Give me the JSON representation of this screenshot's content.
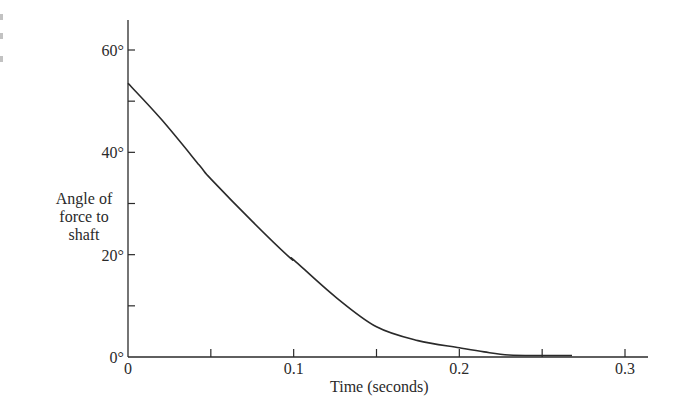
{
  "chart_data": {
    "type": "line",
    "title": "",
    "xlabel": "Time (seconds)",
    "ylabel": "Angle of force to shaft",
    "ylabel_lines": [
      "Angle of",
      "force to",
      "shaft"
    ],
    "xlim": [
      0,
      0.3
    ],
    "ylim": [
      0,
      60
    ],
    "x_ticks": [
      0,
      0.05,
      0.1,
      0.15,
      0.2,
      0.25,
      0.3
    ],
    "x_tick_labels": [
      "0",
      "",
      "0.1",
      "",
      "0.2",
      "",
      "0.3"
    ],
    "y_ticks": [
      0,
      10,
      20,
      30,
      40,
      50,
      60
    ],
    "y_tick_labels": [
      "0°",
      "",
      "20°",
      "",
      "40°",
      "",
      "60°"
    ],
    "grid": false,
    "legend": null,
    "series": [
      {
        "name": "Angle of force to shaft",
        "x": [
          0,
          0.02,
          0.043,
          0.05,
          0.075,
          0.098,
          0.1,
          0.125,
          0.15,
          0.175,
          0.2,
          0.215,
          0.23,
          0.25,
          0.268
        ],
        "y": [
          53.5,
          46.5,
          37.5,
          34.8,
          26.5,
          19.3,
          19.0,
          11.8,
          5.9,
          3.2,
          1.8,
          1.0,
          0.4,
          0.3,
          0.3
        ]
      }
    ]
  }
}
